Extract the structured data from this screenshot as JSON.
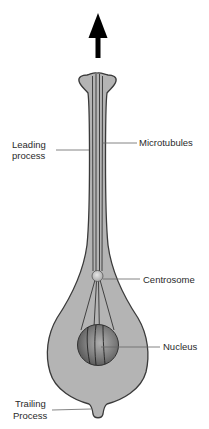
{
  "diagram": {
    "direction_arrow": "up-arrow-icon",
    "labels": {
      "leading_process_line1": "Leading",
      "leading_process_line2": "process",
      "microtubules": "Microtubules",
      "centrosome": "Centrosome",
      "nucleus": "Nucleus",
      "trailing_process_line1": "Trailing",
      "trailing_process_line2": "Process"
    },
    "colors": {
      "cell_fill": "#b4b4b4",
      "cell_outline": "#3a3a3a",
      "nucleus_fill": "#7a7a7a",
      "centrosome_fill": "#c8c8c8",
      "arrow": "#000000",
      "leader_line": "#555555",
      "text": "#2a2a2a"
    }
  }
}
